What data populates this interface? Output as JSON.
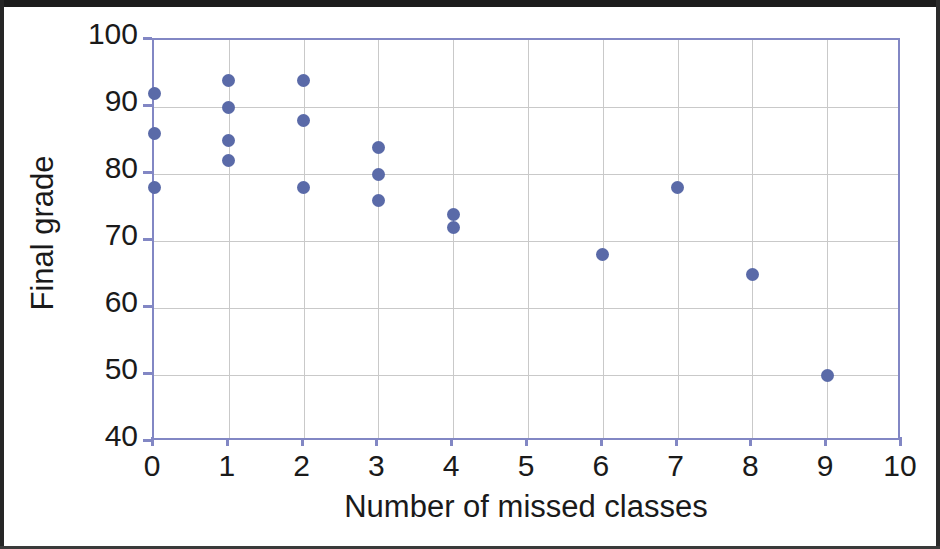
{
  "chart_data": {
    "type": "scatter",
    "title": "",
    "xlabel": "Number of missed classes",
    "ylabel": "Final grade",
    "xlim": [
      0,
      10
    ],
    "ylim": [
      40,
      100
    ],
    "xticks": [
      "0",
      "1",
      "2",
      "3",
      "4",
      "5",
      "6",
      "7",
      "8",
      "9",
      "10"
    ],
    "yticks": [
      "40",
      "50",
      "60",
      "70",
      "80",
      "90",
      "100"
    ],
    "grid": true,
    "legend": "none",
    "marker_color": "#5a6aa8",
    "axis_color": "#8287c4",
    "gridline_color": "#c9c9c9",
    "points": [
      {
        "x": 0,
        "y": 92
      },
      {
        "x": 0,
        "y": 86
      },
      {
        "x": 0,
        "y": 78
      },
      {
        "x": 1,
        "y": 94
      },
      {
        "x": 1,
        "y": 90
      },
      {
        "x": 1,
        "y": 85
      },
      {
        "x": 1,
        "y": 82
      },
      {
        "x": 2,
        "y": 94
      },
      {
        "x": 2,
        "y": 88
      },
      {
        "x": 2,
        "y": 78
      },
      {
        "x": 3,
        "y": 84
      },
      {
        "x": 3,
        "y": 80
      },
      {
        "x": 3,
        "y": 76
      },
      {
        "x": 4,
        "y": 74
      },
      {
        "x": 4,
        "y": 72
      },
      {
        "x": 6,
        "y": 68
      },
      {
        "x": 7,
        "y": 78
      },
      {
        "x": 8,
        "y": 65
      },
      {
        "x": 9,
        "y": 50
      }
    ]
  }
}
